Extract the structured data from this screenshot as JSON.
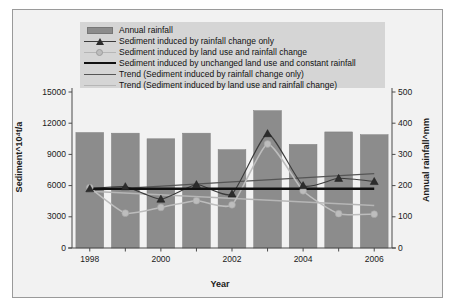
{
  "chart_data": {
    "type": "bar",
    "title": "",
    "xlabel": "Year",
    "ylabel": "Sediment^10⁴t/a",
    "y2label": "Annual rainfall^mm",
    "categories": [
      "1998",
      "1999",
      "2000",
      "2001",
      "2002",
      "2003",
      "2004",
      "2005",
      "2006"
    ],
    "x_tick_labels": [
      "1998",
      "2000",
      "2002",
      "2004",
      "2006"
    ],
    "ylim": [
      0,
      15000
    ],
    "y_ticks": [
      "0",
      "3000",
      "6000",
      "9000",
      "12000",
      "15000"
    ],
    "y2lim": [
      0,
      500
    ],
    "y2_ticks": [
      "0",
      "100",
      "200",
      "300",
      "400",
      "500"
    ],
    "grid": false,
    "legend_position": "top-center",
    "series": [
      {
        "name": "Annual rainfall",
        "type": "bar",
        "axis": "right",
        "unit": "mm",
        "values": [
          370,
          368,
          350,
          368,
          315,
          440,
          332,
          372,
          363
        ],
        "color": "#8c8c8c"
      },
      {
        "name": "Sediment induced by rainfall change only",
        "type": "line",
        "marker": "triangle",
        "axis": "left",
        "unit": "10^4 t/a",
        "values": [
          5700,
          5900,
          4700,
          6100,
          5200,
          11000,
          6000,
          6700,
          6400
        ],
        "color": "#3b3b3b"
      },
      {
        "name": "Sediment induced by land use and rainfall change",
        "type": "line",
        "marker": "circle",
        "axis": "left",
        "unit": "10^4 t/a",
        "values": [
          5800,
          3350,
          3900,
          4550,
          4150,
          10000,
          5500,
          3300,
          3250
        ],
        "color": "#bdbdbd"
      },
      {
        "name": "Sediment induced by unchanged land use and constant rainfall",
        "type": "line",
        "marker": "none",
        "axis": "left",
        "unit": "10^4 t/a",
        "values": [
          5700,
          5700,
          5700,
          5700,
          5700,
          5700,
          5700,
          5700,
          5700
        ],
        "color": "#111111"
      },
      {
        "name": "Trend (Sediment induced by rainfall change only)",
        "type": "trend",
        "axis": "left",
        "values": [
          5550,
          5750,
          5950,
          6150,
          6350,
          6550,
          6750,
          6950,
          7150
        ],
        "color": "#555555"
      },
      {
        "name": "Trend (Sediment induced by land use and rainfall change)",
        "type": "trend",
        "axis": "left",
        "values": [
          5450,
          5280,
          5110,
          4940,
          4770,
          4600,
          4430,
          4260,
          4090
        ],
        "color": "#b6b6b6"
      }
    ]
  },
  "legend": {
    "items": [
      {
        "label": "Annual rainfall",
        "key": "swatch"
      },
      {
        "label": "Sediment induced by rainfall change only",
        "key": "line-triangle"
      },
      {
        "label": "Sediment induced by land use and rainfall change",
        "key": "line-circle"
      },
      {
        "label": "Sediment induced by unchanged land use and constant rainfall",
        "key": "line-thick"
      },
      {
        "label": "Trend (Sediment induced by rainfall change only)",
        "key": "line-mid"
      },
      {
        "label": "Trend (Sediment induced by land use and rainfall change)",
        "key": "line-light"
      }
    ]
  },
  "axes": {
    "left_title": "Sediment^10⁴t/a",
    "right_title": "Annual rainfall^mm",
    "bottom_title": "Year"
  }
}
